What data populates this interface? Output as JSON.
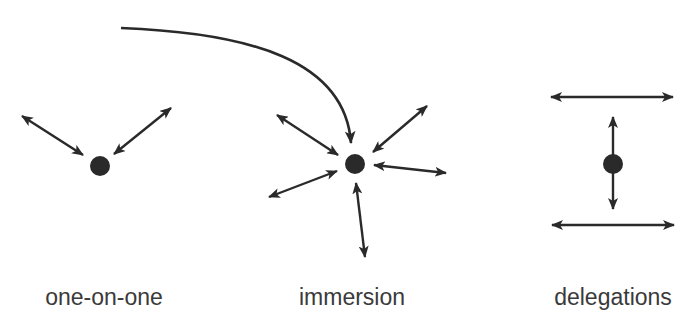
{
  "diagram": {
    "type": "interaction-modes",
    "colors": {
      "ink": "#2a2a2a",
      "label": "#3a3a3a",
      "background": "#ffffff"
    },
    "groups": [
      {
        "id": "one-on-one",
        "label": "one-on-one",
        "label_x": 104,
        "node": {
          "cx": 100,
          "cy": 166,
          "r": 10
        },
        "arrows": [
          {
            "x1": 22,
            "y1": 116,
            "x2": 83,
            "y2": 155
          },
          {
            "x1": 114,
            "y1": 154,
            "x2": 171,
            "y2": 108
          }
        ]
      },
      {
        "id": "immersion",
        "label": "immersion",
        "label_x": 352,
        "node": {
          "cx": 355,
          "cy": 164,
          "r": 10
        },
        "arrows": [
          {
            "x1": 277,
            "y1": 115,
            "x2": 338,
            "y2": 155
          },
          {
            "x1": 373,
            "y1": 152,
            "x2": 427,
            "y2": 106
          },
          {
            "x1": 374,
            "y1": 165,
            "x2": 446,
            "y2": 173
          },
          {
            "x1": 269,
            "y1": 197,
            "x2": 337,
            "y2": 171
          },
          {
            "x1": 356,
            "y1": 183,
            "x2": 365,
            "y2": 257
          }
        ],
        "incoming_curve": {
          "d": "M 121 28 C 250 33, 345 60, 351 143"
        }
      },
      {
        "id": "delegations",
        "label": "delegations",
        "label_x": 613,
        "node": {
          "cx": 613,
          "cy": 164,
          "r": 10
        },
        "arrows": [
          {
            "x1": 551,
            "y1": 97,
            "x2": 673,
            "y2": 97
          },
          {
            "x1": 613,
            "y1": 117,
            "x2": 613,
            "y2": 209
          },
          {
            "x1": 552,
            "y1": 225,
            "x2": 674,
            "y2": 225
          }
        ]
      }
    ]
  }
}
